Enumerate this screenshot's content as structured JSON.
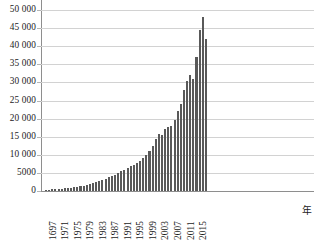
{
  "chart_data": {
    "type": "bar",
    "title": "",
    "subtitle": "",
    "xlabel": "年",
    "ylabel": "",
    "ylim": [
      0,
      50000
    ],
    "y_ticks": [
      0,
      5000,
      10000,
      15000,
      20000,
      25000,
      30000,
      35000,
      40000,
      45000,
      50000
    ],
    "y_tick_labels": [
      "0",
      "5000",
      "10 000",
      "15 000",
      "20 000",
      "25 000",
      "30 000",
      "35 000",
      "40 000",
      "45 000",
      "50 000"
    ],
    "grid": true,
    "legend": false,
    "x_tick_labels": [
      "1697",
      "1971",
      "1975",
      "1979",
      "1983",
      "1987",
      "1991",
      "1995",
      "1999",
      "2003",
      "2007",
      "2011",
      "2015"
    ],
    "x_tick_interval_years": 4,
    "categories": [
      "1697",
      "1968",
      "1969",
      "1970",
      "1971",
      "1972",
      "1973",
      "1974",
      "1975",
      "1976",
      "1977",
      "1978",
      "1979",
      "1980",
      "1981",
      "1982",
      "1983",
      "1984",
      "1985",
      "1986",
      "1987",
      "1988",
      "1989",
      "1990",
      "1991",
      "1992",
      "1993",
      "1994",
      "1995",
      "1996",
      "1997",
      "1998",
      "1999",
      "2000",
      "2001",
      "2002",
      "2003",
      "2004",
      "2005",
      "2006",
      "2007",
      "2008",
      "2009",
      "2010",
      "2011",
      "2012",
      "2013",
      "2014",
      "2015",
      "2016",
      "2017",
      "2018"
    ],
    "values": [
      300,
      400,
      450,
      520,
      600,
      680,
      760,
      860,
      950,
      1050,
      1200,
      1350,
      1500,
      1700,
      1900,
      2100,
      2400,
      2700,
      3000,
      3400,
      3800,
      4200,
      4500,
      5000,
      5400,
      5900,
      6300,
      6800,
      7300,
      7800,
      8400,
      9200,
      10000,
      11000,
      12500,
      14500,
      15800,
      15400,
      17000,
      17800,
      18000,
      19500,
      22000,
      24000,
      28000,
      30500,
      32000,
      31000,
      37000,
      44500,
      48200,
      42000
    ],
    "bar_color": "#595959",
    "grid_color": "#d2d2d2",
    "axis_color": "#8e8e8e",
    "peak_value": 48200,
    "peak_category": "2017",
    "last_value": 42000
  }
}
